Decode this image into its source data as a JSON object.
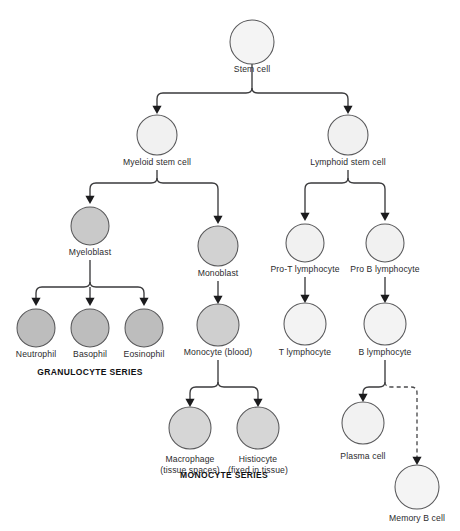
{
  "figure": {
    "background_color": "#ffffff",
    "line_color": "#3a3a3c",
    "circle_stroke_color": "#58585a",
    "label_color": "#2b2b2d",
    "series_label_color": "#111113"
  },
  "palette": {
    "very_light": "#f4f4f4",
    "light": "#eeeeee",
    "medium": "#d6d6d6",
    "dark": "#bdbdbd"
  },
  "cells": [
    {
      "id": "stem-cell",
      "label": "Stem cell",
      "cx": 252,
      "cy": 42,
      "r": 22,
      "fill": "#f4f4f4",
      "label_y": 72,
      "lines": [
        "Stem cell"
      ]
    },
    {
      "id": "myeloid-stem",
      "label": "Myeloid stem cell",
      "cx": 157,
      "cy": 135,
      "r": 20,
      "fill": "#f1f1f1",
      "label_y": 165,
      "lines": [
        "Myeloid stem cell"
      ]
    },
    {
      "id": "lymphoid-stem",
      "label": "Lymphoid stem cell",
      "cx": 348,
      "cy": 135,
      "r": 20,
      "fill": "#f1f1f1",
      "label_y": 165,
      "lines": [
        "Lymphoid stem cell"
      ]
    },
    {
      "id": "myeloblast",
      "label": "Myeloblast",
      "cx": 90,
      "cy": 226,
      "r": 19,
      "fill": "#c9c9c9",
      "label_y": 255,
      "lines": [
        "Myeloblast"
      ]
    },
    {
      "id": "monoblast",
      "label": "Monoblast",
      "cx": 218,
      "cy": 246,
      "r": 20,
      "fill": "#d2d2d2",
      "label_y": 276,
      "lines": [
        "Monoblast"
      ]
    },
    {
      "id": "pro-t-lymphocyte",
      "label": "Pro-T lymphocyte",
      "cx": 305,
      "cy": 243,
      "r": 19,
      "fill": "#f1f1f1",
      "label_y": 272,
      "lines": [
        "Pro-T lymphocyte"
      ]
    },
    {
      "id": "pro-b-lymphocyte",
      "label": "Pro B lymphocyte",
      "cx": 385,
      "cy": 243,
      "r": 19,
      "fill": "#f1f1f1",
      "label_y": 272,
      "lines": [
        "Pro B lymphocyte"
      ]
    },
    {
      "id": "neutrophil",
      "label": "Neutrophil",
      "cx": 36,
      "cy": 328,
      "r": 19,
      "fill": "#bdbdbd",
      "label_y": 357,
      "lines": [
        "Neutrophil"
      ]
    },
    {
      "id": "basophil",
      "label": "Basophil",
      "cx": 90,
      "cy": 328,
      "r": 19,
      "fill": "#bdbdbd",
      "label_y": 357,
      "lines": [
        "Basophil"
      ]
    },
    {
      "id": "eosinophil",
      "label": "Eosinophil",
      "cx": 144,
      "cy": 328,
      "r": 19,
      "fill": "#bdbdbd",
      "label_y": 357,
      "lines": [
        "Eosinophil"
      ]
    },
    {
      "id": "monocyte",
      "label": "Monocyte (blood)",
      "cx": 218,
      "cy": 325,
      "r": 21,
      "fill": "#cfcfcf",
      "label_y": 355,
      "lines": [
        "Monocyte (blood)"
      ]
    },
    {
      "id": "t-lymphocyte",
      "label": "T lymphocyte",
      "cx": 305,
      "cy": 324,
      "r": 21,
      "fill": "#f3f3f3",
      "label_y": 355,
      "lines": [
        "T lymphocyte"
      ]
    },
    {
      "id": "b-lymphocyte",
      "label": "B lymphocyte",
      "cx": 385,
      "cy": 324,
      "r": 21,
      "fill": "#f3f3f3",
      "label_y": 355,
      "lines": [
        "B lymphocyte"
      ]
    },
    {
      "id": "macrophage",
      "label": "Macrophage (tissue spaces)",
      "cx": 190,
      "cy": 428,
      "r": 21,
      "fill": "#d6d6d6",
      "label_y": 462,
      "lines": [
        "Macrophage",
        "(tissue spaces)"
      ]
    },
    {
      "id": "histiocyte",
      "label": "Histiocyte (fixed in tissue)",
      "cx": 258,
      "cy": 428,
      "r": 21,
      "fill": "#d6d6d6",
      "label_y": 462,
      "lines": [
        "Histiocyte",
        "(fixed in tissue)"
      ]
    },
    {
      "id": "plasma-cell",
      "label": "Plasma cell",
      "cx": 363,
      "cy": 423,
      "r": 21,
      "fill": "#f2f2f2",
      "label_y": 459,
      "lines": [
        "Plasma cell"
      ]
    },
    {
      "id": "memory-b-cell",
      "label": "Memory B cell",
      "cx": 417,
      "cy": 487,
      "r": 22,
      "fill": "#f4f4f4",
      "label_y": 521,
      "lines": [
        "Memory B cell"
      ]
    }
  ],
  "series_labels": [
    {
      "id": "granulocyte-series",
      "text": "GRANULOCYTE SERIES",
      "x": 90,
      "y": 375
    },
    {
      "id": "monocyte-series",
      "text": "MONOCYTE SERIES",
      "x": 224,
      "y": 478
    }
  ],
  "connectors": [
    {
      "id": "stem-to-branch-stem",
      "from": "stem-cell",
      "d": "M 252 64 L 252 88",
      "style": "solid",
      "arrow": null
    },
    {
      "id": "stem-to-myeloid",
      "from": "stem-cell",
      "to": "myeloid-stem",
      "d": "M 252 88 Q 252 93 246 93 L 163 93 Q 157 93 157 99 L 157 106",
      "style": "solid",
      "arrow": {
        "x": 157,
        "y": 114,
        "dir": "down"
      }
    },
    {
      "id": "stem-to-lymphoid",
      "from": "stem-cell",
      "to": "lymphoid-stem",
      "d": "M 252 88 Q 252 93 258 93 L 342 93 Q 348 93 348 99 L 348 106",
      "style": "solid",
      "arrow": {
        "x": 348,
        "y": 114,
        "dir": "down"
      }
    },
    {
      "id": "myeloid-stem-stub",
      "from": "myeloid-stem",
      "d": "M 157 170 L 157 178",
      "style": "solid",
      "arrow": null
    },
    {
      "id": "myeloid-to-myeloblast",
      "from": "myeloid-stem",
      "to": "myeloblast",
      "d": "M 157 178 Q 157 183 151 183 L 96 183 Q 90 183 90 189 L 90 196",
      "style": "solid",
      "arrow": {
        "x": 90,
        "y": 204,
        "dir": "down"
      }
    },
    {
      "id": "myeloid-to-monoblast",
      "from": "myeloid-stem",
      "to": "monoblast",
      "d": "M 157 178 Q 157 183 163 183 L 212 183 Q 218 183 218 189 L 218 216",
      "style": "solid",
      "arrow": {
        "x": 218,
        "y": 224,
        "dir": "down"
      }
    },
    {
      "id": "lymphoid-stem-stub",
      "from": "lymphoid-stem",
      "d": "M 348 170 L 348 178",
      "style": "solid",
      "arrow": null
    },
    {
      "id": "lymphoid-to-prot",
      "from": "lymphoid-stem",
      "to": "pro-t-lymphocyte",
      "d": "M 348 178 Q 348 183 342 183 L 311 183 Q 305 183 305 189 L 305 213",
      "style": "solid",
      "arrow": {
        "x": 305,
        "y": 221,
        "dir": "down"
      }
    },
    {
      "id": "lymphoid-to-prob",
      "from": "lymphoid-stem",
      "to": "pro-b-lymphocyte",
      "d": "M 348 178 Q 348 183 354 183 L 379 183 Q 385 183 385 189 L 385 213",
      "style": "solid",
      "arrow": {
        "x": 385,
        "y": 221,
        "dir": "down"
      }
    },
    {
      "id": "myeloblast-stub",
      "from": "myeloblast",
      "d": "M 90 260 L 90 282",
      "style": "solid",
      "arrow": null
    },
    {
      "id": "myeloblast-to-neutrophil",
      "from": "myeloblast",
      "to": "neutrophil",
      "d": "M 90 282 Q 90 287 84 287 L 42 287 Q 36 287 36 293 L 36 298",
      "style": "solid",
      "arrow": {
        "x": 36,
        "y": 306,
        "dir": "down"
      }
    },
    {
      "id": "myeloblast-to-basophil",
      "from": "myeloblast",
      "to": "basophil",
      "d": "M 90 287 L 90 298",
      "style": "solid",
      "arrow": {
        "x": 90,
        "y": 306,
        "dir": "down"
      }
    },
    {
      "id": "myeloblast-to-eosinophil",
      "from": "myeloblast",
      "to": "eosinophil",
      "d": "M 90 282 Q 90 287 96 287 L 138 287 Q 144 287 144 293 L 144 298",
      "style": "solid",
      "arrow": {
        "x": 144,
        "y": 306,
        "dir": "down"
      }
    },
    {
      "id": "monoblast-to-monocyte",
      "from": "monoblast",
      "to": "monocyte",
      "d": "M 218 281 L 218 296",
      "style": "solid",
      "arrow": {
        "x": 218,
        "y": 304,
        "dir": "down"
      }
    },
    {
      "id": "prot-to-t",
      "from": "pro-t-lymphocyte",
      "to": "t-lymphocyte",
      "d": "M 305 277 L 305 295",
      "style": "solid",
      "arrow": {
        "x": 305,
        "y": 303,
        "dir": "down"
      }
    },
    {
      "id": "prob-to-b",
      "from": "pro-b-lymphocyte",
      "to": "b-lymphocyte",
      "d": "M 385 277 L 385 295",
      "style": "solid",
      "arrow": {
        "x": 385,
        "y": 303,
        "dir": "down"
      }
    },
    {
      "id": "monocyte-stub",
      "from": "monocyte",
      "d": "M 218 360 L 218 382",
      "style": "solid",
      "arrow": null
    },
    {
      "id": "monocyte-to-macrophage",
      "from": "monocyte",
      "to": "macrophage",
      "d": "M 218 382 Q 218 387 212 387 L 196 387 Q 190 387 190 393 L 190 399",
      "style": "solid",
      "arrow": {
        "x": 190,
        "y": 407,
        "dir": "down"
      }
    },
    {
      "id": "monocyte-to-histiocyte",
      "from": "monocyte",
      "to": "histiocyte",
      "d": "M 218 382 Q 218 387 224 387 L 252 387 Q 258 387 258 393 L 258 399",
      "style": "solid",
      "arrow": {
        "x": 258,
        "y": 407,
        "dir": "down"
      }
    },
    {
      "id": "b-lymphocyte-stub",
      "from": "b-lymphocyte",
      "d": "M 385 360 L 385 382",
      "style": "solid",
      "arrow": null
    },
    {
      "id": "b-to-plasma",
      "from": "b-lymphocyte",
      "to": "plasma-cell",
      "d": "M 385 382 Q 385 387 379 387 L 369 387 Q 363 387 363 393 L 363 394",
      "style": "solid",
      "arrow": {
        "x": 363,
        "y": 402,
        "dir": "down"
      }
    },
    {
      "id": "b-to-memory",
      "from": "b-lymphocyte",
      "to": "memory-b-cell",
      "d": "M 385 382 Q 385 387 391 387 L 411 387 Q 417 387 417 393 L 417 457",
      "style": "dashed",
      "arrow": {
        "x": 417,
        "y": 465,
        "dir": "down"
      }
    }
  ]
}
